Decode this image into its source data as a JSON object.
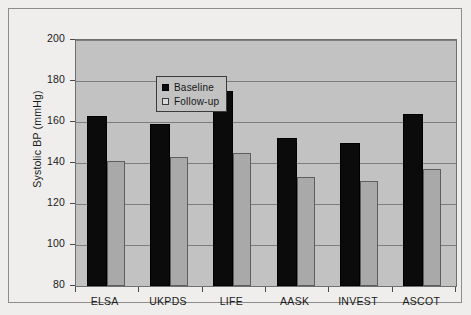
{
  "chart_data": {
    "type": "bar",
    "title": "",
    "subtitle": "",
    "xlabel": "",
    "ylabel": "Systolic BP (mmHg)",
    "ylim": [
      80,
      200
    ],
    "yticks": [
      80,
      100,
      120,
      140,
      160,
      180,
      200
    ],
    "grid": true,
    "legend_position": "upper-left-inside",
    "categories": [
      "ELSA",
      "UKPDS",
      "LIFE",
      "AASK",
      "INVEST",
      "ASCOT"
    ],
    "series": [
      {
        "name": "Baseline",
        "color": "#0b0b0b",
        "values": [
          163,
          159,
          175,
          152,
          150,
          164
        ]
      },
      {
        "name": "Follow-up",
        "color": "#a9a9a9",
        "values": [
          141,
          143,
          145,
          133,
          131,
          137
        ]
      }
    ]
  },
  "legend": {
    "items": [
      {
        "label": "Baseline",
        "swatch": "filled-black-square"
      },
      {
        "label": "Follow-up",
        "swatch": "open-white-square"
      }
    ]
  },
  "colors": {
    "page_background": "#efeeec",
    "plot_background": "#c2c2c2",
    "gridline": "#7d7d7d",
    "axis": "#4a4a4a",
    "text": "#1a1a1a",
    "baseline_bar": "#0b0b0b",
    "followup_bar": "#a9a9a9"
  }
}
